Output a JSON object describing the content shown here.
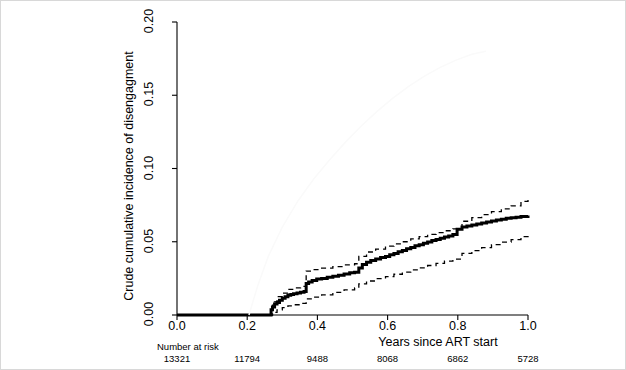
{
  "figure": {
    "background": "#ffffff",
    "border_color": "#d8d8d8"
  },
  "axes": {
    "x_label": "Years since ART start",
    "y_label": "Crude cumulative incidence of disengagment",
    "x_ticks": [
      "0.0",
      "0.2",
      "0.4",
      "0.6",
      "0.8",
      "1.0"
    ],
    "y_ticks": [
      "0.00",
      "0.05",
      "0.10",
      "0.15",
      "0.20"
    ]
  },
  "risk_table": {
    "title": "Number at risk",
    "values": [
      "13321",
      "11794",
      "9488",
      "8068",
      "6862",
      "5728"
    ]
  },
  "chart_data": {
    "type": "line",
    "title": "",
    "subtitle": "",
    "xlabel": "Years since ART start",
    "ylabel": "Crude cumulative incidence of disengagment",
    "xlim": [
      0.0,
      1.0
    ],
    "ylim": [
      0.0,
      0.2
    ],
    "xticks": [
      0.0,
      0.2,
      0.4,
      0.6,
      0.8,
      1.0
    ],
    "yticks": [
      0.0,
      0.05,
      0.1,
      0.15,
      0.2
    ],
    "grid": false,
    "legend": "none",
    "step_style": "step-post",
    "annotations": {
      "number_at_risk_label": "Number at risk",
      "number_at_risk": [
        {
          "x": 0.0,
          "n": 13321
        },
        {
          "x": 0.2,
          "n": 11794
        },
        {
          "x": 0.4,
          "n": 9488
        },
        {
          "x": 0.6,
          "n": 8068
        },
        {
          "x": 0.8,
          "n": 6862
        },
        {
          "x": 1.0,
          "n": 5728
        }
      ]
    },
    "series": [
      {
        "name": "Crude cumulative incidence (estimate)",
        "style": "solid-bold",
        "color": "#000000",
        "width": 3.0,
        "x": [
          0.0,
          0.262,
          0.268,
          0.272,
          0.278,
          0.285,
          0.292,
          0.3,
          0.308,
          0.316,
          0.324,
          0.332,
          0.342,
          0.352,
          0.362,
          0.368,
          0.375,
          0.385,
          0.398,
          0.412,
          0.428,
          0.444,
          0.46,
          0.476,
          0.492,
          0.506,
          0.518,
          0.528,
          0.54,
          0.552,
          0.566,
          0.58,
          0.594,
          0.606,
          0.618,
          0.63,
          0.642,
          0.654,
          0.666,
          0.678,
          0.69,
          0.702,
          0.714,
          0.726,
          0.738,
          0.75,
          0.762,
          0.774,
          0.786,
          0.798,
          0.812,
          0.826,
          0.84,
          0.854,
          0.868,
          0.882,
          0.896,
          0.91,
          0.924,
          0.938,
          0.952,
          0.966,
          0.98,
          1.0
        ],
        "y": [
          0.0,
          0.0,
          0.0035,
          0.0055,
          0.0075,
          0.0085,
          0.01,
          0.0115,
          0.0125,
          0.0135,
          0.014,
          0.0145,
          0.015,
          0.0155,
          0.016,
          0.0215,
          0.0225,
          0.0235,
          0.0245,
          0.025,
          0.0258,
          0.0265,
          0.0272,
          0.028,
          0.0288,
          0.0292,
          0.032,
          0.0345,
          0.036,
          0.0372,
          0.0382,
          0.0392,
          0.04,
          0.0412,
          0.042,
          0.0432,
          0.044,
          0.0452,
          0.046,
          0.0472,
          0.048,
          0.049,
          0.0498,
          0.0508,
          0.0516,
          0.0524,
          0.0532,
          0.054,
          0.055,
          0.0585,
          0.06,
          0.0608,
          0.0615,
          0.0622,
          0.0628,
          0.0635,
          0.0642,
          0.0648,
          0.0654,
          0.066,
          0.0664,
          0.0668,
          0.0672,
          0.068
        ]
      },
      {
        "name": "Upper 95% confidence limit",
        "style": "dashed",
        "color": "#000000",
        "width": 1.3,
        "x": [
          0.262,
          0.272,
          0.285,
          0.3,
          0.316,
          0.332,
          0.352,
          0.368,
          0.385,
          0.412,
          0.444,
          0.476,
          0.506,
          0.518,
          0.54,
          0.566,
          0.594,
          0.618,
          0.642,
          0.666,
          0.69,
          0.714,
          0.738,
          0.762,
          0.786,
          0.812,
          0.84,
          0.868,
          0.896,
          0.924,
          0.952,
          0.98,
          1.0
        ],
        "y": [
          0.0,
          0.009,
          0.0125,
          0.015,
          0.0175,
          0.0185,
          0.0195,
          0.03,
          0.031,
          0.032,
          0.033,
          0.0342,
          0.035,
          0.04,
          0.043,
          0.045,
          0.047,
          0.0485,
          0.05,
          0.052,
          0.0535,
          0.055,
          0.0562,
          0.0575,
          0.0588,
          0.064,
          0.0665,
          0.0685,
          0.0705,
          0.0725,
          0.0745,
          0.0775,
          0.079
        ]
      },
      {
        "name": "Lower 95% confidence limit",
        "style": "dashed",
        "color": "#000000",
        "width": 1.3,
        "x": [
          0.262,
          0.272,
          0.285,
          0.3,
          0.316,
          0.332,
          0.352,
          0.368,
          0.385,
          0.412,
          0.444,
          0.476,
          0.506,
          0.518,
          0.54,
          0.566,
          0.594,
          0.618,
          0.642,
          0.666,
          0.69,
          0.714,
          0.738,
          0.762,
          0.786,
          0.812,
          0.84,
          0.868,
          0.896,
          0.924,
          0.952,
          0.98,
          1.0
        ],
        "y": [
          0.0,
          0.0018,
          0.0035,
          0.005,
          0.0062,
          0.007,
          0.008,
          0.011,
          0.0122,
          0.0138,
          0.0155,
          0.0172,
          0.0185,
          0.0212,
          0.0232,
          0.0248,
          0.0262,
          0.0278,
          0.0292,
          0.0308,
          0.0322,
          0.0338,
          0.0352,
          0.0368,
          0.0382,
          0.042,
          0.044,
          0.046,
          0.048,
          0.0498,
          0.0515,
          0.0535,
          0.0552
        ]
      },
      {
        "name": "Faint background curve",
        "style": "solid-faint",
        "color": "#fafafa",
        "width": 1.5,
        "x": [
          0.205,
          0.23,
          0.26,
          0.3,
          0.345,
          0.39,
          0.435,
          0.48,
          0.525,
          0.57,
          0.615,
          0.66,
          0.705,
          0.75,
          0.795,
          0.84,
          0.88
        ],
        "y": [
          0.0,
          0.02,
          0.04,
          0.06,
          0.078,
          0.093,
          0.106,
          0.118,
          0.129,
          0.139,
          0.148,
          0.156,
          0.163,
          0.169,
          0.174,
          0.178,
          0.18
        ]
      }
    ]
  }
}
